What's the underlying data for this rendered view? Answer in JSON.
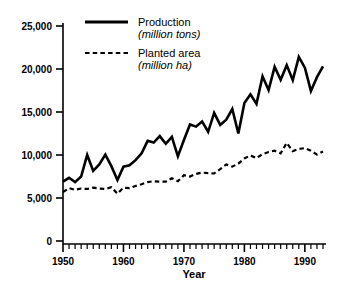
{
  "chart_data": {
    "type": "line",
    "title": "",
    "subtitle": "",
    "xlabel": "Year",
    "ylabel": "",
    "xlim": [
      1950,
      1993
    ],
    "ylim": [
      0,
      25000
    ],
    "grid": false,
    "legend_position": "top-center",
    "x_tick_labels": [
      "1950",
      "1960",
      "1970",
      "1980",
      "1990"
    ],
    "x_tick_values": [
      1950,
      1960,
      1970,
      1980,
      1990
    ],
    "x_minor_tick_step": 1,
    "y_tick_labels": [
      "0",
      "5,000",
      "10,000",
      "15,000",
      "20,000",
      "25,000"
    ],
    "y_tick_values": [
      0,
      5000,
      10000,
      15000,
      20000,
      25000
    ],
    "x": [
      1950,
      1951,
      1952,
      1953,
      1954,
      1955,
      1956,
      1957,
      1958,
      1959,
      1960,
      1961,
      1962,
      1963,
      1964,
      1965,
      1966,
      1967,
      1968,
      1969,
      1970,
      1971,
      1972,
      1973,
      1974,
      1975,
      1976,
      1977,
      1978,
      1979,
      1980,
      1981,
      1982,
      1983,
      1984,
      1985,
      1986,
      1987,
      1988,
      1989,
      1990,
      1991,
      1992,
      1993
    ],
    "series": [
      {
        "name": "Production",
        "units": "million tons",
        "style": "solid",
        "color": "#000000",
        "values": [
          6900,
          7350,
          6850,
          7500,
          10000,
          8150,
          8900,
          10050,
          8700,
          7100,
          8650,
          8800,
          9400,
          10200,
          11650,
          11450,
          12200,
          11300,
          12100,
          9850,
          11750,
          13550,
          13300,
          13900,
          12700,
          14900,
          13500,
          14100,
          15350,
          12500,
          16050,
          17050,
          15950,
          19150,
          17550,
          20250,
          18750,
          20450,
          18700,
          21400,
          20150,
          17450,
          19050,
          20300
        ]
      },
      {
        "name": "Planted area",
        "units": "million ha",
        "style": "dashed",
        "color": "#000000",
        "values": [
          5700,
          6150,
          5950,
          6100,
          6050,
          6200,
          6100,
          6050,
          6250,
          5500,
          6200,
          6150,
          6400,
          6600,
          6850,
          6950,
          6900,
          6900,
          7300,
          6950,
          7650,
          7500,
          7800,
          7950,
          7900,
          7850,
          8350,
          8900,
          8650,
          9000,
          9600,
          9950,
          9650,
          10100,
          10350,
          10500,
          10200,
          11400,
          10450,
          10700,
          10800,
          10500,
          10050,
          10400
        ]
      }
    ],
    "legend_entries": [
      {
        "label": "Production",
        "sub": "(million tons)",
        "style": "solid"
      },
      {
        "label": "Planted area",
        "sub": "(million ha)",
        "style": "dashed"
      }
    ]
  }
}
